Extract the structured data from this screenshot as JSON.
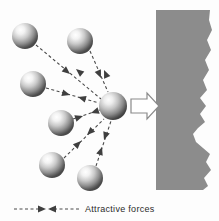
{
  "figure": {
    "background_color": "#fdfdfd"
  },
  "legend": {
    "label": "Attractive forces",
    "symbol": "double-headed-dashed-arrow",
    "line_color": "#4a4a4a",
    "text_color": "#2b2b2b"
  },
  "wall": {
    "name": "bulk-solid-wall",
    "fill_color": "#8c8c8c",
    "x": 156,
    "y": 10,
    "width": 63,
    "height": 180,
    "edge_style": "wavy-irregular"
  },
  "motion_arrow": {
    "name": "net-force-arrow",
    "direction": "right",
    "fill_color": "#ffffff",
    "stroke_color": "#8a8a8a",
    "x": 131,
    "y": 93,
    "width": 28,
    "height": 26
  },
  "spheres": {
    "highlight_color": "#ffffff",
    "mid_color": "#bfbfbf",
    "shadow_color": "#4a4a4a",
    "radius": 13,
    "center_radius": 14,
    "items": [
      {
        "id": "molecule-1",
        "cx": 25,
        "cy": 36,
        "r": 13,
        "role": "surrounding"
      },
      {
        "id": "molecule-2",
        "cx": 80,
        "cy": 41,
        "r": 13,
        "role": "surrounding"
      },
      {
        "id": "molecule-3",
        "cx": 33,
        "cy": 84,
        "r": 13,
        "role": "surrounding"
      },
      {
        "id": "molecule-4",
        "cx": 61,
        "cy": 123,
        "r": 13,
        "role": "surrounding"
      },
      {
        "id": "molecule-5",
        "cx": 52,
        "cy": 165,
        "r": 13,
        "role": "surrounding"
      },
      {
        "id": "molecule-6",
        "cx": 90,
        "cy": 178,
        "r": 13,
        "role": "surrounding"
      },
      {
        "id": "molecule-center",
        "cx": 113,
        "cy": 106,
        "r": 14,
        "role": "central"
      }
    ]
  },
  "force_lines": {
    "stroke_color": "#4a4a4a",
    "dash": "3,2.5",
    "arrow_pairs": 6,
    "items": [
      {
        "id": "force-line-1",
        "from_molecule": "molecule-1",
        "x1": 36,
        "y1": 45,
        "x2": 101,
        "y2": 99
      },
      {
        "id": "force-line-2",
        "from_molecule": "molecule-2",
        "x1": 90,
        "y1": 51,
        "x2": 108,
        "y2": 92
      },
      {
        "id": "force-line-3",
        "from_molecule": "molecule-3",
        "x1": 46,
        "y1": 88,
        "x2": 99,
        "y2": 103
      },
      {
        "id": "force-line-4",
        "from_molecule": "molecule-4",
        "x1": 73,
        "y1": 119,
        "x2": 100,
        "y2": 110
      },
      {
        "id": "force-line-5",
        "from_molecule": "molecule-5",
        "x1": 64,
        "y1": 158,
        "x2": 104,
        "y2": 119
      },
      {
        "id": "force-line-6",
        "from_molecule": "molecule-6",
        "x1": 96,
        "y1": 166,
        "x2": 111,
        "y2": 121
      }
    ]
  }
}
